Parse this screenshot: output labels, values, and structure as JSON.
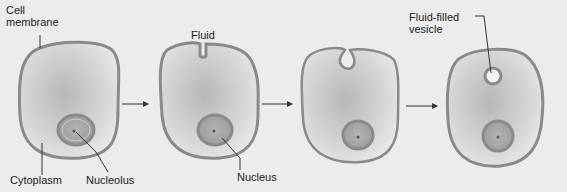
{
  "figure": {
    "stages": [
      {
        "id": 1,
        "labels": {
          "cell_membrane": "Cell\nmembrane",
          "cytoplasm": "Cytoplasm",
          "nucleolus": "Nucleolus"
        }
      },
      {
        "id": 2,
        "labels": {
          "fluid": "Fluid",
          "nucleus": "Nucleus"
        }
      },
      {
        "id": 3,
        "labels": {}
      },
      {
        "id": 4,
        "labels": {
          "vesicle": "Fluid-filled\nvesicle"
        }
      }
    ],
    "labels": {
      "cell_membrane_1": "Cell",
      "cell_membrane_2": "membrane",
      "cytoplasm": "Cytoplasm",
      "nucleolus": "Nucleolus",
      "fluid": "Fluid",
      "nucleus": "Nucleus",
      "vesicle_1": "Fluid-filled",
      "vesicle_2": "vesicle"
    },
    "colors": {
      "background": "#ececec",
      "membrane": "#8a8a8a",
      "cytoplasm_center": "#bdbdbd",
      "cytoplasm_edge": "#e8e8e8",
      "nucleus_fill": "#a9a9a9",
      "arrow": "#333333"
    }
  }
}
